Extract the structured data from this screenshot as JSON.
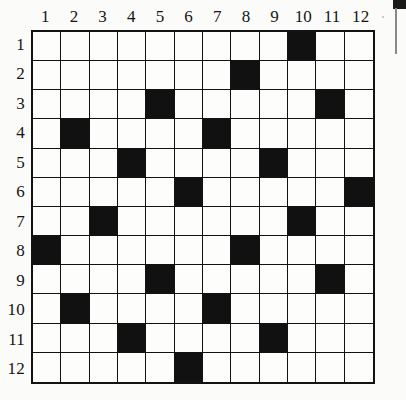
{
  "puzzle": {
    "title": "12x12 grid pattern",
    "rows": 12,
    "columns": 12,
    "column_headers": [
      "1",
      "2",
      "3",
      "4",
      "5",
      "6",
      "7",
      "8",
      "9",
      "10",
      "11",
      "12"
    ],
    "row_headers": [
      "1",
      "2",
      "3",
      "4",
      "5",
      "6",
      "7",
      "8",
      "9",
      "10",
      "11",
      "12"
    ],
    "colors": {
      "filled": "#111111",
      "empty": "#fdfdfb",
      "grid_line": "#121212",
      "page_background": "#fbfbf9",
      "label_text": "#141414"
    },
    "filled_cells_by_row": [
      [
        10
      ],
      [
        8
      ],
      [
        5,
        11
      ],
      [
        2,
        7
      ],
      [
        4,
        9
      ],
      [
        6,
        12
      ],
      [
        3,
        10
      ],
      [
        1,
        8
      ],
      [
        5,
        11
      ],
      [
        2,
        7
      ],
      [
        4,
        9
      ],
      [
        6
      ]
    ],
    "grid_matrix": [
      [
        0,
        0,
        0,
        0,
        0,
        0,
        0,
        0,
        0,
        1,
        0,
        0
      ],
      [
        0,
        0,
        0,
        0,
        0,
        0,
        0,
        1,
        0,
        0,
        0,
        0
      ],
      [
        0,
        0,
        0,
        0,
        1,
        0,
        0,
        0,
        0,
        0,
        1,
        0
      ],
      [
        0,
        1,
        0,
        0,
        0,
        0,
        1,
        0,
        0,
        0,
        0,
        0
      ],
      [
        0,
        0,
        0,
        1,
        0,
        0,
        0,
        0,
        1,
        0,
        0,
        0
      ],
      [
        0,
        0,
        0,
        0,
        0,
        1,
        0,
        0,
        0,
        0,
        0,
        1
      ],
      [
        0,
        0,
        1,
        0,
        0,
        0,
        0,
        0,
        0,
        1,
        0,
        0
      ],
      [
        1,
        0,
        0,
        0,
        0,
        0,
        0,
        1,
        0,
        0,
        0,
        0
      ],
      [
        0,
        0,
        0,
        0,
        1,
        0,
        0,
        0,
        0,
        0,
        1,
        0
      ],
      [
        0,
        1,
        0,
        0,
        0,
        0,
        1,
        0,
        0,
        0,
        0,
        0
      ],
      [
        0,
        0,
        0,
        1,
        0,
        0,
        0,
        0,
        1,
        0,
        0,
        0
      ],
      [
        0,
        0,
        0,
        0,
        0,
        1,
        0,
        0,
        0,
        0,
        0,
        0
      ]
    ],
    "filled_count": 22
  },
  "artifacts": {
    "top_right_block": "scan-mark",
    "vertical_line": "scan-line"
  }
}
